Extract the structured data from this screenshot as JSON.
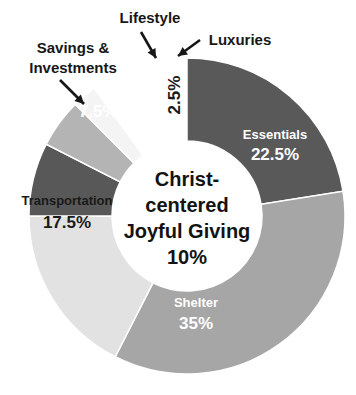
{
  "chart_data": {
    "type": "pie",
    "variant": "donut",
    "title": "",
    "subtitle": "",
    "xlabel": "",
    "ylabel": "",
    "legend_position": "none",
    "grid": false,
    "total": 100,
    "units": "percent",
    "center_label": {
      "lines": [
        "Christ-",
        "centered",
        "Joyful Giving",
        "10%"
      ],
      "name": "Christ-centered Joyful Giving",
      "value": 10,
      "value_text": "10%"
    },
    "categories": [
      "Essentials",
      "Shelter",
      "Transportation",
      "Savings & Investments",
      "Lifestyle",
      "Luxuries"
    ],
    "values": [
      22.5,
      35,
      17.5,
      7.5,
      5,
      2.5
    ],
    "value_labels": [
      "22.5%",
      "35%",
      "17.5%",
      "7.5%",
      "5%",
      "2.5%"
    ],
    "colors": [
      "#595959",
      "#a6a6a6",
      "#e2e2e2",
      "#585858",
      "#b4b4b4",
      "#f4f4f4"
    ],
    "slices": [
      {
        "name": "Essentials",
        "value": 22.5,
        "value_text": "22.5%",
        "color": "#595959",
        "label_placement": "inside",
        "label_color": "#ffffff",
        "name_x": 275,
        "name_y": 139,
        "value_x": 275,
        "value_y": 160
      },
      {
        "name": "Shelter",
        "value": 35,
        "value_text": "35%",
        "color": "#a6a6a6",
        "label_placement": "inside",
        "label_color": "#ffffff",
        "name_x": 196,
        "name_y": 307,
        "value_x": 196,
        "value_y": 329
      },
      {
        "name": "Transportation",
        "value": 17.5,
        "value_text": "17.5%",
        "color": "#e2e2e2",
        "label_placement": "inside",
        "label_color": "#1a1a1a",
        "name_x": 67,
        "name_y": 205,
        "value_x": 67,
        "value_y": 228
      },
      {
        "name": "Savings & Investments",
        "value": 7.5,
        "value_text": "7.5%",
        "color": "#585858",
        "label_placement": "callout",
        "label_color": "#ffffff",
        "value_x": 98,
        "value_y": 117,
        "callout_lines": [
          "Savings &",
          "Investments"
        ],
        "callout_x": 73,
        "callout_y": 53,
        "callout_line2_y": 73
      },
      {
        "name": "Lifestyle",
        "value": 5,
        "value_text": "5%",
        "color": "#b4b4b4",
        "label_placement": "callout",
        "label_color": "#ffffff",
        "value_x": 138,
        "value_y": 91,
        "callout_lines": [
          "Lifestyle"
        ],
        "callout_x": 150,
        "callout_y": 23
      },
      {
        "name": "Luxuries",
        "value": 2.5,
        "value_text": "2.5%",
        "color": "#f4f4f4",
        "label_placement": "callout-rotated",
        "label_color": "#1a1a1a",
        "value_x": 180,
        "value_y": 95,
        "callout_lines": [
          "Luxuries"
        ],
        "callout_x": 240,
        "callout_y": 45
      }
    ]
  },
  "geometry": {
    "cx": 187,
    "cy": 216,
    "outer_radius": 158,
    "inner_radius": 75,
    "start_angle_deg": -90
  }
}
